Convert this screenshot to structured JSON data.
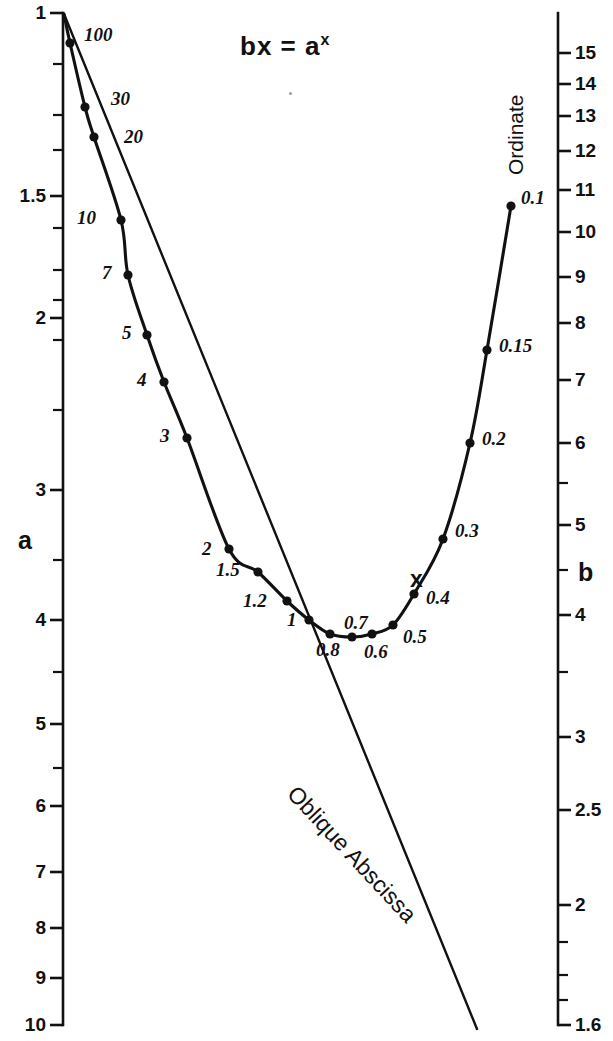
{
  "title": {
    "text": "bx = a",
    "exponent": "x"
  },
  "axes": {
    "left": {
      "name": "a",
      "name_pos": {
        "x": 18,
        "y": 528
      },
      "scale": "log-descending",
      "x": 63,
      "y_top": 13,
      "y_bottom": 1025,
      "ticks": [
        {
          "value": "1",
          "y": 13,
          "major": true
        },
        {
          "value": "",
          "y": 64,
          "major": false
        },
        {
          "value": "",
          "y": 115,
          "major": false
        },
        {
          "value": "",
          "y": 150,
          "major": false
        },
        {
          "value": "1.5",
          "y": 196,
          "major": true
        },
        {
          "value": "",
          "y": 228,
          "major": false
        },
        {
          "value": "",
          "y": 270,
          "major": false
        },
        {
          "value": "",
          "y": 300,
          "major": false
        },
        {
          "value": "",
          "y": 340,
          "major": false
        },
        {
          "value": "2",
          "y": 318,
          "major": true
        },
        {
          "value": "",
          "y": 410,
          "major": false
        },
        {
          "value": "3",
          "y": 490,
          "major": true
        },
        {
          "value": "",
          "y": 560,
          "major": false
        },
        {
          "value": "4",
          "y": 620,
          "major": true
        },
        {
          "value": "",
          "y": 672,
          "major": false
        },
        {
          "value": "5",
          "y": 724,
          "major": true
        },
        {
          "value": "",
          "y": 768,
          "major": false
        },
        {
          "value": "6",
          "y": 806,
          "major": true
        },
        {
          "value": "7",
          "y": 872,
          "major": true
        },
        {
          "value": "8",
          "y": 928,
          "major": true
        },
        {
          "value": "9",
          "y": 978,
          "major": true
        },
        {
          "value": "10",
          "y": 1025,
          "major": true
        }
      ]
    },
    "right": {
      "name": "b",
      "name_pos": {
        "x": 578,
        "y": 560
      },
      "secondary_name": "Ordinate",
      "scale": "log-descending",
      "x": 558,
      "y_top": 13,
      "y_bottom": 1025,
      "ticks": [
        {
          "value": "15",
          "y": 53,
          "major": true
        },
        {
          "value": "14",
          "y": 84,
          "major": true
        },
        {
          "value": "13",
          "y": 116,
          "major": true
        },
        {
          "value": "12",
          "y": 151,
          "major": true
        },
        {
          "value": "11",
          "y": 190,
          "major": true
        },
        {
          "value": "10",
          "y": 232,
          "major": true
        },
        {
          "value": "9",
          "y": 277,
          "major": true
        },
        {
          "value": "8",
          "y": 323,
          "major": true
        },
        {
          "value": "7",
          "y": 380,
          "major": true
        },
        {
          "value": "6",
          "y": 443,
          "major": true
        },
        {
          "value": "",
          "y": 483,
          "major": false
        },
        {
          "value": "5",
          "y": 525,
          "major": true
        },
        {
          "value": "",
          "y": 570,
          "major": false
        },
        {
          "value": "4",
          "y": 615,
          "major": true
        },
        {
          "value": "",
          "y": 672,
          "major": false
        },
        {
          "value": "3",
          "y": 737,
          "major": true
        },
        {
          "value": "2.5",
          "y": 810,
          "major": true
        },
        {
          "value": "2",
          "y": 905,
          "major": true
        },
        {
          "value": "",
          "y": 942,
          "major": false
        },
        {
          "value": "",
          "y": 975,
          "major": false
        },
        {
          "value": "",
          "y": 1000,
          "major": false
        },
        {
          "value": "1.6",
          "y": 1025,
          "major": true
        }
      ]
    }
  },
  "oblique_line": {
    "label": "Oblique Abscissa",
    "label_pos": {
      "x": 300,
      "y": 782
    },
    "from": {
      "x": 64,
      "y": 14
    },
    "to": {
      "x": 477,
      "y": 1029
    }
  },
  "x_marker": {
    "label": "x",
    "x": 410,
    "y": 568
  },
  "chart_data": {
    "type": "line",
    "xlabel": "Oblique Abscissa",
    "ylabel": "a",
    "y2label": "b",
    "y2axis_title": "Ordinate",
    "grid": false,
    "legend": null,
    "note": "Nomogram for solving bx = a^x. Left log axis 'a' runs 1 (top) to 10 (bottom); right log axis 'b' runs 15 (top) to 1.6 (bottom). Points on the U-shaped curve are labelled with values of x; the straight 'Oblique Abscissa' line also emanates from the common apex.",
    "left_axis_range": [
      1,
      10
    ],
    "right_axis_range": [
      15,
      1.6
    ],
    "series": [
      {
        "name": "x-curve",
        "label_key": "x",
        "points": [
          {
            "label": "100",
            "x": 70,
            "y": 43
          },
          {
            "label": "30",
            "x": 85,
            "y": 107
          },
          {
            "label": "20",
            "x": 94,
            "y": 137
          },
          {
            "label": "10",
            "x": 121,
            "y": 220
          },
          {
            "label": "7",
            "x": 128,
            "y": 275
          },
          {
            "label": "5",
            "x": 147,
            "y": 335
          },
          {
            "label": "4",
            "x": 164,
            "y": 382
          },
          {
            "label": "3",
            "x": 187,
            "y": 438
          },
          {
            "label": "2",
            "x": 229,
            "y": 549
          },
          {
            "label": "1.5",
            "x": 258,
            "y": 572
          },
          {
            "label": "1.2",
            "x": 287,
            "y": 601
          },
          {
            "label": "1",
            "x": 309,
            "y": 620
          },
          {
            "label": "0.8",
            "x": 330,
            "y": 634
          },
          {
            "label": "0.7",
            "x": 352,
            "y": 637
          },
          {
            "label": "0.6",
            "x": 372,
            "y": 634
          },
          {
            "label": "0.5",
            "x": 393,
            "y": 625
          },
          {
            "label": "0.4",
            "x": 414,
            "y": 594
          },
          {
            "label": "0.3",
            "x": 443,
            "y": 539
          },
          {
            "label": "0.2",
            "x": 470,
            "y": 443
          },
          {
            "label": "0.15",
            "x": 487,
            "y": 350
          },
          {
            "label": "0.1",
            "x": 511,
            "y": 206
          }
        ]
      }
    ]
  }
}
